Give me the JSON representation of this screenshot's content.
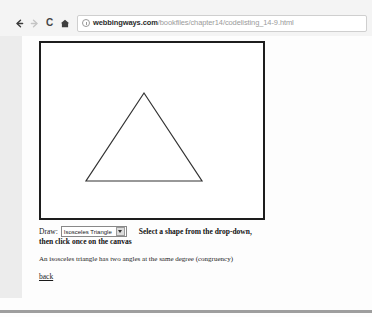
{
  "browser": {
    "back_icon": "back-arrow-icon",
    "forward_icon": "forward-arrow-icon",
    "reload_label": "C",
    "home_icon": "home-icon",
    "url_info_icon": "page-info-icon",
    "url_host": "webbingways.com",
    "url_path": "/bookfiles/chapter14/codelisting_14-9.html"
  },
  "page": {
    "canvas": {
      "shape": "isosceles-triangle",
      "stroke_color": "#333333",
      "fill": "none",
      "points": "103,50 45,138 161,138"
    },
    "form": {
      "draw_label": "Draw:",
      "selected_shape": "Isosceles Triangle",
      "dropdown_icon": "chevron-down-icon",
      "options": [
        "Isosceles Triangle"
      ]
    },
    "hint_line_1": "Select a shape from the drop-down,",
    "hint_line_2": "then click once on the canvas",
    "description": "An isosceles triangle has two angles at the same degree (congruency)",
    "back_link": "back"
  }
}
